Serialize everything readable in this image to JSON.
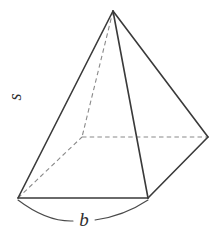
{
  "figure": {
    "name": "square-pyramid",
    "shape_label": "square pyramid",
    "stroke_color": "#3a3a3a",
    "hidden_stroke_color": "#8a8a8a",
    "background_color": "#ffffff",
    "labels": {
      "slant_height": "s",
      "base_edge": "b"
    },
    "vertices": {
      "apex": {
        "x": 113,
        "y": 11
      },
      "base_left": {
        "x": 18,
        "y": 198
      },
      "base_front": {
        "x": 148,
        "y": 198
      },
      "base_right": {
        "x": 208,
        "y": 137
      },
      "base_back_hidden": {
        "x": 82,
        "y": 137
      }
    },
    "edges_visible": [
      "apex-base_left",
      "apex-base_front",
      "apex-base_right",
      "base_left-base_front",
      "base_front-base_right"
    ],
    "edges_hidden": [
      "apex-base_back_hidden",
      "base_left-base_back_hidden",
      "base_back_hidden-base_right"
    ],
    "annotations": {
      "base_measure_arc": "arc spanning front base edge from base_left to base_front",
      "slant_label_rotation_deg": -90
    }
  }
}
